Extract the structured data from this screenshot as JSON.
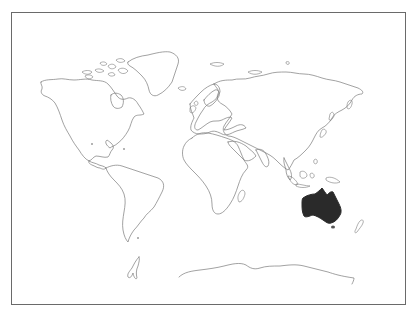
{
  "map": {
    "type": "world-outline",
    "highlighted_region": "Australia",
    "highlight_color": "#2a2a2a",
    "outline_color": "#7a7a7a",
    "frame_color": "#6a6a6a",
    "continents": [
      "North America",
      "South America",
      "Europe",
      "Africa",
      "Asia",
      "Australia",
      "Antarctica",
      "Greenland"
    ]
  }
}
